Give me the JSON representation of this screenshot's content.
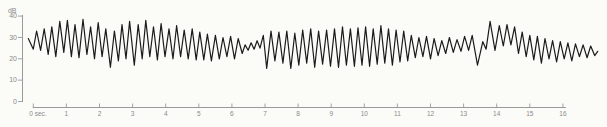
{
  "chart_data": {
    "type": "line",
    "title": "",
    "xlabel": "sec",
    "ylabel": "dB",
    "xlim": [
      0,
      16
    ],
    "ylim": [
      0,
      40
    ],
    "grid": false,
    "legend": "none",
    "x_tick_values": [
      0,
      1,
      2,
      3,
      4,
      5,
      6,
      7,
      8,
      9,
      10,
      11,
      12,
      13,
      14,
      15,
      16
    ],
    "x_tick_labels": [
      "0 sec.",
      "1",
      "2",
      "3",
      "4",
      "5",
      "6",
      "7",
      "8",
      "9",
      "10",
      "11",
      "12",
      "13",
      "14",
      "15",
      "16"
    ],
    "y_tick_values": [
      0,
      10,
      20,
      30,
      40
    ],
    "y_tick_labels": [
      "0",
      "10",
      "20",
      "30",
      "40"
    ],
    "colors": {
      "trace": "#1b1b1b",
      "axis": "#8f8f8f",
      "labels": "#8a8a8a",
      "background": "#fbfbf8"
    },
    "series": [
      {
        "name": "sound-level",
        "points": [
          [
            -0.15,
            29.5
          ],
          [
            0.0,
            24.5
          ],
          [
            0.1,
            33
          ],
          [
            0.22,
            24
          ],
          [
            0.33,
            34
          ],
          [
            0.45,
            22
          ],
          [
            0.56,
            35
          ],
          [
            0.68,
            21
          ],
          [
            0.8,
            37.5
          ],
          [
            0.92,
            23
          ],
          [
            1.03,
            38
          ],
          [
            1.15,
            21
          ],
          [
            1.26,
            36
          ],
          [
            1.38,
            20.5
          ],
          [
            1.5,
            38.5
          ],
          [
            1.62,
            22
          ],
          [
            1.73,
            35
          ],
          [
            1.85,
            20
          ],
          [
            1.96,
            37
          ],
          [
            2.08,
            21
          ],
          [
            2.19,
            34
          ],
          [
            2.33,
            16
          ],
          [
            2.45,
            33
          ],
          [
            2.57,
            19
          ],
          [
            2.68,
            36
          ],
          [
            2.8,
            20
          ],
          [
            2.91,
            37.5
          ],
          [
            3.05,
            17
          ],
          [
            3.17,
            36
          ],
          [
            3.29,
            20
          ],
          [
            3.4,
            38
          ],
          [
            3.52,
            21
          ],
          [
            3.63,
            35
          ],
          [
            3.75,
            19.5
          ],
          [
            3.86,
            36.5
          ],
          [
            3.98,
            21
          ],
          [
            4.1,
            34
          ],
          [
            4.22,
            20
          ],
          [
            4.33,
            35.5
          ],
          [
            4.45,
            21
          ],
          [
            4.56,
            33.5
          ],
          [
            4.68,
            20
          ],
          [
            4.8,
            34
          ],
          [
            4.92,
            19.5
          ],
          [
            5.03,
            32.5
          ],
          [
            5.15,
            19.5
          ],
          [
            5.26,
            31.5
          ],
          [
            5.38,
            19
          ],
          [
            5.5,
            31
          ],
          [
            5.62,
            20
          ],
          [
            5.73,
            30
          ],
          [
            5.85,
            21
          ],
          [
            5.96,
            30.5
          ],
          [
            6.08,
            20
          ],
          [
            6.19,
            29.5
          ],
          [
            6.31,
            22.5
          ],
          [
            6.4,
            26.5
          ],
          [
            6.49,
            24
          ],
          [
            6.58,
            27.5
          ],
          [
            6.67,
            24.5
          ],
          [
            6.76,
            28.5
          ],
          [
            6.85,
            25
          ],
          [
            6.95,
            31
          ],
          [
            7.05,
            15.5
          ],
          [
            7.18,
            33
          ],
          [
            7.3,
            19
          ],
          [
            7.42,
            32.5
          ],
          [
            7.54,
            18
          ],
          [
            7.66,
            33
          ],
          [
            7.78,
            15.5
          ],
          [
            7.9,
            32
          ],
          [
            8.02,
            17
          ],
          [
            8.14,
            33.5
          ],
          [
            8.26,
            18
          ],
          [
            8.38,
            34
          ],
          [
            8.5,
            16
          ],
          [
            8.62,
            33
          ],
          [
            8.74,
            17.5
          ],
          [
            8.86,
            33.5
          ],
          [
            8.98,
            16.5
          ],
          [
            9.1,
            34
          ],
          [
            9.22,
            16
          ],
          [
            9.34,
            35
          ],
          [
            9.46,
            17
          ],
          [
            9.58,
            34
          ],
          [
            9.7,
            16.5
          ],
          [
            9.81,
            34.5
          ],
          [
            9.93,
            17
          ],
          [
            10.04,
            35
          ],
          [
            10.16,
            16.5
          ],
          [
            10.27,
            34
          ],
          [
            10.39,
            17.5
          ],
          [
            10.5,
            35.5
          ],
          [
            10.62,
            18
          ],
          [
            10.73,
            34
          ],
          [
            10.85,
            17
          ],
          [
            10.96,
            33.5
          ],
          [
            11.08,
            18.5
          ],
          [
            11.19,
            33
          ],
          [
            11.31,
            19
          ],
          [
            11.42,
            31
          ],
          [
            11.54,
            20.5
          ],
          [
            11.65,
            30
          ],
          [
            11.77,
            21
          ],
          [
            11.88,
            30.5
          ],
          [
            12.0,
            20
          ],
          [
            12.11,
            29.5
          ],
          [
            12.23,
            21.5
          ],
          [
            12.34,
            28.5
          ],
          [
            12.46,
            22.5
          ],
          [
            12.57,
            30
          ],
          [
            12.69,
            23
          ],
          [
            12.8,
            29
          ],
          [
            12.92,
            23.5
          ],
          [
            13.03,
            30.5
          ],
          [
            13.15,
            24
          ],
          [
            13.26,
            31
          ],
          [
            13.42,
            17
          ],
          [
            13.58,
            28
          ],
          [
            13.68,
            24.5
          ],
          [
            13.8,
            37.5
          ],
          [
            13.95,
            24
          ],
          [
            14.08,
            35.5
          ],
          [
            14.2,
            26
          ],
          [
            14.31,
            36
          ],
          [
            14.43,
            26.5
          ],
          [
            14.54,
            35
          ],
          [
            14.66,
            22.5
          ],
          [
            14.77,
            32.5
          ],
          [
            14.89,
            21
          ],
          [
            15.0,
            31
          ],
          [
            15.12,
            19.5
          ],
          [
            15.23,
            30.5
          ],
          [
            15.35,
            18
          ],
          [
            15.46,
            29.5
          ],
          [
            15.58,
            20
          ],
          [
            15.69,
            28.5
          ],
          [
            15.81,
            18.5
          ],
          [
            15.92,
            28
          ],
          [
            16.04,
            20
          ],
          [
            16.15,
            27.5
          ],
          [
            16.27,
            19
          ],
          [
            16.38,
            27
          ],
          [
            16.5,
            21
          ],
          [
            16.61,
            26.5
          ],
          [
            16.73,
            20.5
          ],
          [
            16.84,
            26
          ],
          [
            16.96,
            21.5
          ],
          [
            17.05,
            23.5
          ]
        ]
      }
    ]
  }
}
